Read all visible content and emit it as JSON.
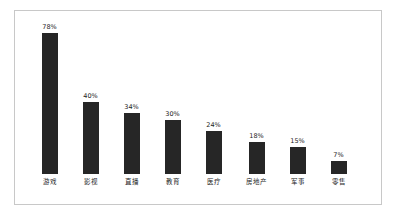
{
  "figure": {
    "background_color": "#ffffff",
    "frame_color": "#c8c8c8"
  },
  "chart_data": {
    "type": "bar",
    "title": "",
    "subtitle": "",
    "xlabel": "",
    "ylabel": "",
    "ylim": [
      0,
      78
    ],
    "grid": false,
    "legend": "none",
    "bar_color": "#262626",
    "label_color": "#1d1d1d",
    "categories": [
      "游戏",
      "影视",
      "直播",
      "教育",
      "医疗",
      "房地产",
      "军事",
      "零售"
    ],
    "values": [
      78,
      40,
      34,
      30,
      24,
      18,
      15,
      7
    ],
    "value_labels": [
      "78%",
      "40%",
      "34%",
      "30%",
      "24%",
      "18%",
      "15%",
      "7%"
    ],
    "points": [
      {
        "category": "游戏",
        "value": 78,
        "value_label": "78%"
      },
      {
        "category": "影视",
        "value": 40,
        "value_label": "40%"
      },
      {
        "category": "直播",
        "value": 34,
        "value_label": "34%"
      },
      {
        "category": "教育",
        "value": 30,
        "value_label": "30%"
      },
      {
        "category": "医疗",
        "value": 24,
        "value_label": "24%"
      },
      {
        "category": "房地产",
        "value": 18,
        "value_label": "18%"
      },
      {
        "category": "军事",
        "value": 15,
        "value_label": "15%"
      },
      {
        "category": "零售",
        "value": 7,
        "value_label": "7%"
      }
    ]
  }
}
